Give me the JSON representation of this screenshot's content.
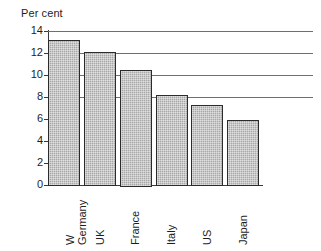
{
  "chart_data": {
    "type": "bar",
    "title": "",
    "ylabel": "Per cent",
    "xlabel": "",
    "categories": [
      "W\nGermany",
      "UK",
      "France",
      "Italy",
      "US",
      "Japan"
    ],
    "values": [
      13.2,
      12.1,
      10.5,
      8.2,
      7.3,
      5.9
    ],
    "ylim": [
      0,
      14
    ],
    "ytick_labels": [
      "14",
      "12",
      "10",
      "8",
      "6",
      "4",
      "2",
      "0"
    ],
    "ytick_values": [
      14,
      12,
      10,
      8,
      6,
      4,
      2,
      0
    ],
    "grid": "horizontal gridlines at 8, 10, 12, 14 extending right past plot area",
    "gridline_values": [
      14,
      12,
      10,
      8
    ],
    "legend": "none",
    "bar_fill_color": "#a8a8a8",
    "bar_border_color": "#2b2b2b",
    "axis_color": "#3a3a3a"
  },
  "axis": {
    "y_title": "Per cent"
  }
}
